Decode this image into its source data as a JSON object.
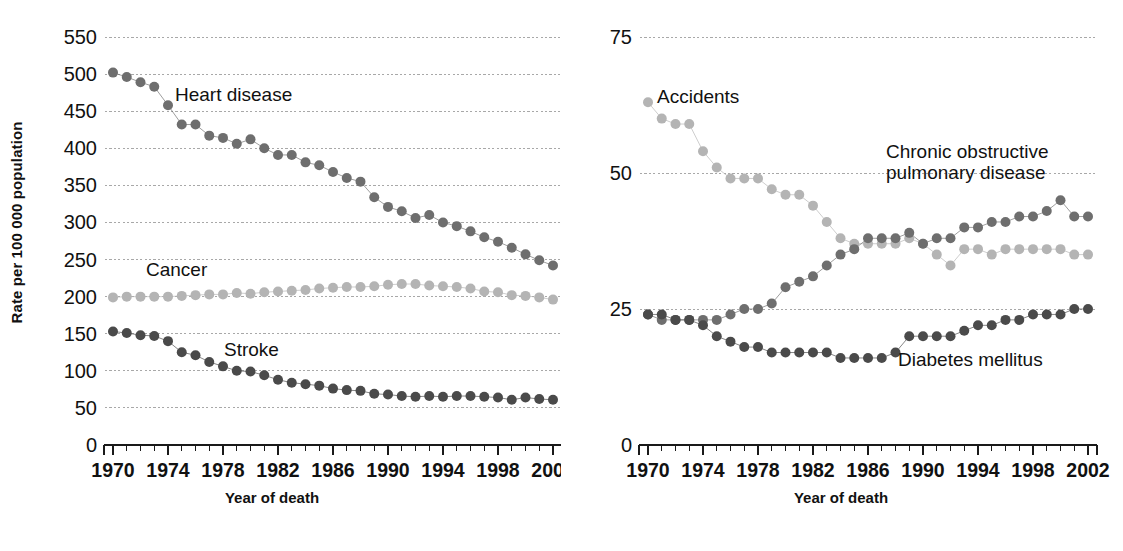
{
  "figure": {
    "panels": [
      {
        "id": "left",
        "ylabel": "Rate per 100 000 population",
        "xlabel": "Year of death",
        "yticks": [
          "0",
          "50",
          "100",
          "150",
          "200",
          "250",
          "300",
          "350",
          "400",
          "450",
          "500",
          "550"
        ],
        "xticks": [
          "1970",
          "1974",
          "1978",
          "1982",
          "1986",
          "1990",
          "1994",
          "1998",
          "2002"
        ],
        "labels": [
          {
            "name": "heart-disease",
            "text": "Heart disease",
            "x": 175,
            "y": 84
          },
          {
            "name": "cancer",
            "text": "Cancer",
            "x": 146,
            "y": 259
          },
          {
            "name": "stroke",
            "text": "Stroke",
            "x": 224,
            "y": 339
          }
        ]
      },
      {
        "id": "right",
        "ylabel": "",
        "xlabel": "Year of death",
        "yticks": [
          "0",
          "25",
          "50",
          "75"
        ],
        "xticks": [
          "1970",
          "1974",
          "1978",
          "1982",
          "1986",
          "1990",
          "1994",
          "1998",
          "2002"
        ],
        "labels": [
          {
            "name": "accidents",
            "text": "Accidents",
            "x": 96,
            "y": 86
          },
          {
            "name": "copd",
            "text": "Chronic obstructive\npulmonary disease",
            "x": 325,
            "y": 141
          },
          {
            "name": "diabetes-mellitus",
            "text": "Diabetes mellitus",
            "x": 337,
            "y": 349
          }
        ]
      }
    ],
    "colors": {
      "dark_gray": "#4a4a4a",
      "mid_gray": "#6e6e6e",
      "light_gray": "#b4b4b4",
      "gridline": "#a8a8a8",
      "axis": "#1a1a1a",
      "text": "#111111"
    }
  },
  "chart_data": [
    {
      "type": "scatter",
      "panel": "left",
      "title": "",
      "xlabel": "Year of death",
      "ylabel": "Rate per 100 000 population",
      "xlim": [
        1970,
        2002
      ],
      "ylim": [
        0,
        550
      ],
      "grid": true,
      "legend": "inline-annotations",
      "x": [
        1970,
        1971,
        1972,
        1973,
        1974,
        1975,
        1976,
        1977,
        1978,
        1979,
        1980,
        1981,
        1982,
        1983,
        1984,
        1985,
        1986,
        1987,
        1988,
        1989,
        1990,
        1991,
        1992,
        1993,
        1994,
        1995,
        1996,
        1997,
        1998,
        1999,
        2000,
        2001,
        2002
      ],
      "series": [
        {
          "name": "Heart disease",
          "color": "#6e6e6e",
          "values": [
            502,
            496,
            489,
            483,
            458,
            432,
            432,
            417,
            414,
            406,
            412,
            400,
            391,
            391,
            381,
            377,
            368,
            360,
            355,
            334,
            321,
            315,
            306,
            310,
            300,
            295,
            288,
            280,
            274,
            266,
            257,
            249,
            242
          ]
        },
        {
          "name": "Cancer",
          "color": "#b4b4b4",
          "values": [
            199,
            200,
            200,
            200,
            200,
            201,
            202,
            203,
            203,
            205,
            204,
            206,
            207,
            208,
            209,
            211,
            212,
            213,
            213,
            214,
            216,
            217,
            217,
            215,
            214,
            213,
            211,
            207,
            206,
            202,
            201,
            199,
            196
          ]
        },
        {
          "name": "Stroke",
          "color": "#4a4a4a",
          "values": [
            153,
            151,
            148,
            147,
            140,
            125,
            121,
            112,
            106,
            100,
            99,
            94,
            88,
            84,
            82,
            80,
            76,
            74,
            73,
            69,
            68,
            66,
            65,
            66,
            65,
            66,
            66,
            65,
            64,
            61,
            64,
            62,
            61
          ]
        }
      ]
    },
    {
      "type": "scatter",
      "panel": "right",
      "title": "",
      "xlabel": "Year of death",
      "ylabel": "",
      "xlim": [
        1970,
        2002
      ],
      "ylim": [
        0,
        75
      ],
      "grid": true,
      "legend": "inline-annotations",
      "x": [
        1970,
        1971,
        1972,
        1973,
        1974,
        1975,
        1976,
        1977,
        1978,
        1979,
        1980,
        1981,
        1982,
        1983,
        1984,
        1985,
        1986,
        1987,
        1988,
        1989,
        1990,
        1991,
        1992,
        1993,
        1994,
        1995,
        1996,
        1997,
        1998,
        1999,
        2000,
        2001,
        2002
      ],
      "series": [
        {
          "name": "Accidents",
          "color": "#b4b4b4",
          "values": [
            63,
            60,
            59,
            59,
            54,
            51,
            49,
            49,
            49,
            47,
            46,
            46,
            44,
            41,
            38,
            37,
            37,
            37,
            37,
            38,
            37,
            35,
            33,
            36,
            36,
            35,
            36,
            36,
            36,
            36,
            36,
            35,
            35
          ]
        },
        {
          "name": "Chronic obstructive pulmonary disease",
          "color": "#6e6e6e",
          "values": [
            24,
            23,
            23,
            23,
            23,
            23,
            24,
            25,
            25,
            26,
            29,
            30,
            31,
            33,
            35,
            36,
            38,
            38,
            38,
            39,
            37,
            38,
            38,
            40,
            40,
            41,
            41,
            42,
            42,
            43,
            45,
            42,
            42
          ]
        },
        {
          "name": "Diabetes mellitus",
          "color": "#4a4a4a",
          "values": [
            24,
            24,
            23,
            23,
            22,
            20,
            19,
            18,
            18,
            17,
            17,
            17,
            17,
            17,
            16,
            16,
            16,
            16,
            17,
            20,
            20,
            20,
            20,
            21,
            22,
            22,
            23,
            23,
            24,
            24,
            24,
            25,
            25
          ]
        }
      ]
    }
  ]
}
